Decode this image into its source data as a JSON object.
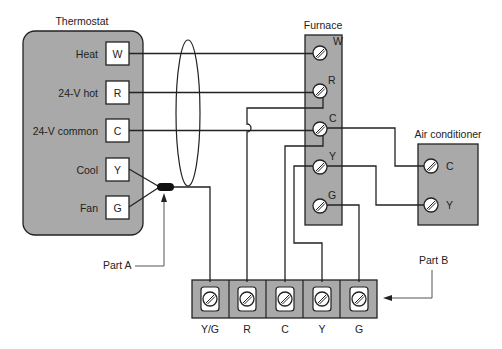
{
  "diagram": {
    "thermostat": {
      "title": "Thermostat",
      "terminals": [
        {
          "label": "Heat",
          "code": "W"
        },
        {
          "label": "24-V hot",
          "code": "R"
        },
        {
          "label": "24-V common",
          "code": "C"
        },
        {
          "label": "Cool",
          "code": "Y"
        },
        {
          "label": "Fan",
          "code": "G"
        }
      ]
    },
    "furnace": {
      "title": "Furnace",
      "terminals": [
        "W",
        "R",
        "C",
        "Y",
        "G"
      ]
    },
    "air_conditioner": {
      "title": "Air conditioner",
      "terminals": [
        "C",
        "Y"
      ]
    },
    "terminal_strip": {
      "terminals": [
        "Y/G",
        "R",
        "C",
        "Y",
        "G"
      ]
    },
    "callouts": {
      "part_a": "Part A",
      "part_b": "Part B"
    },
    "colors": {
      "panel_fill": "#a9a9a9",
      "line": "#222222",
      "background": "#ffffff"
    }
  }
}
